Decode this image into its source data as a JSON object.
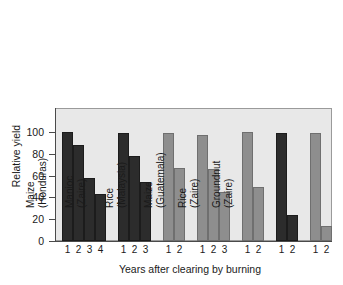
{
  "chart_data": {
    "type": "bar",
    "title": "",
    "xlabel": "Years after clearing by burning",
    "ylabel": "Relative yield",
    "ylim": [
      0,
      100
    ],
    "yticks": [
      0,
      20,
      40,
      60,
      80,
      100
    ],
    "ytick_labels": [
      "0",
      "20",
      "40",
      "60",
      "80",
      "100"
    ],
    "grid": false,
    "legend": "none",
    "groups": [
      {
        "crop": "Cotton",
        "location": "(Southern Sudan)",
        "shade": "dark",
        "color": "#2c2c2c",
        "x": [
          "1",
          "2",
          "3",
          "4"
        ],
        "values": [
          100,
          88,
          58,
          43
        ]
      },
      {
        "crop": "Maize",
        "location": "(Honduras)",
        "shade": "dark",
        "color": "#2c2c2c",
        "x": [
          "1",
          "2",
          "3"
        ],
        "values": [
          99,
          78,
          54
        ]
      },
      {
        "crop": "Manioc",
        "location": "(Zaire)",
        "shade": "gray",
        "color": "#8e8e8e",
        "x": [
          "1",
          "2"
        ],
        "values": [
          99,
          67
        ]
      },
      {
        "crop": "Rice",
        "location": "(Malaysia)",
        "shade": "gray",
        "color": "#8e8e8e",
        "x": [
          "1",
          "2",
          "3"
        ],
        "values": [
          97,
          66,
          45
        ]
      },
      {
        "crop": "Maize",
        "location": "(Guatemala)",
        "shade": "gray",
        "color": "#8e8e8e",
        "x": [
          "1",
          "2"
        ],
        "values": [
          100,
          50
        ]
      },
      {
        "crop": "Rice",
        "location": "(Zaire)",
        "shade": "dark",
        "color": "#2c2c2c",
        "x": [
          "1",
          "2"
        ],
        "values": [
          99,
          24
        ]
      },
      {
        "crop": "Groundnut",
        "location": "(Zaire)",
        "shade": "gray",
        "color": "#8e8e8e",
        "x": [
          "1",
          "2"
        ],
        "values": [
          99,
          14
        ]
      }
    ]
  },
  "axes": {
    "y_title": "Relative yield",
    "x_title": "Years after clearing by burning"
  },
  "style": {
    "plot_background": "#e8e8e8",
    "frame_color": "#9a9a9a",
    "axis_color": "#4a4a4a",
    "bar_dark": "#2c2c2c",
    "bar_gray": "#8e8e8e",
    "page_background": "#ffffff"
  }
}
